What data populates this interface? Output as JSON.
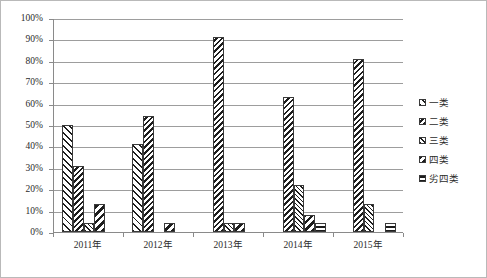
{
  "chart_data": {
    "type": "bar",
    "title": "",
    "subtitle": "",
    "xlabel": "",
    "ylabel": "",
    "categories": [
      "2011年",
      "2012年",
      "2013年",
      "2014年",
      "2015年"
    ],
    "series": [
      {
        "name": "一类",
        "values": [
          50,
          41,
          0,
          0,
          0
        ],
        "pattern": "wide-forward-diagonal"
      },
      {
        "name": "二类",
        "values": [
          31,
          54,
          91,
          63,
          81
        ],
        "pattern": "dense-backward-diagonal"
      },
      {
        "name": "三类",
        "values": [
          4,
          0,
          4,
          22,
          13
        ],
        "pattern": "fine-forward-diagonal"
      },
      {
        "name": "四类",
        "values": [
          13,
          4,
          4,
          8,
          0
        ],
        "pattern": "bold-backward-diagonal"
      },
      {
        "name": "劣四类",
        "values": [
          0,
          0,
          0,
          4,
          4
        ],
        "pattern": "cross-grid"
      }
    ],
    "ylim": [
      0,
      100
    ],
    "ytick_values": [
      0,
      10,
      20,
      30,
      40,
      50,
      60,
      70,
      80,
      90,
      100
    ],
    "ytick_labels": [
      "0%",
      "10%",
      "20%",
      "30%",
      "40%",
      "50%",
      "60%",
      "70%",
      "80%",
      "90%",
      "100%"
    ],
    "grid": true,
    "grid_axis": "y",
    "legend_position": "right",
    "value_suffix": "%",
    "colors": {
      "background": "#ffffff",
      "plot_border": "#b9b9b9",
      "axis_line": "#8a8a8a",
      "gridline": "#9d9d9d",
      "bar_outline": "#3a3a3a",
      "hatch": "#1d1d1d",
      "text": "#2b2b2b"
    }
  },
  "legend": {
    "items": [
      {
        "label": "一类"
      },
      {
        "label": "二类"
      },
      {
        "label": "三类"
      },
      {
        "label": "四类"
      },
      {
        "label": "劣四类"
      }
    ]
  }
}
